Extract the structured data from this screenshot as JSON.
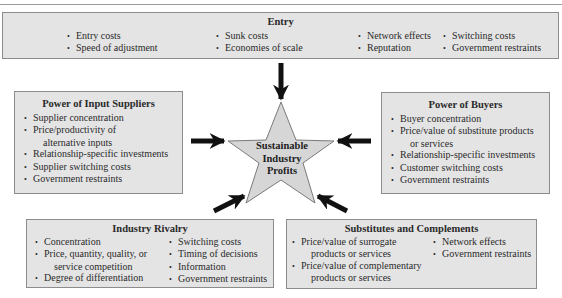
{
  "diagram_title": "Sustainable Industry Profits",
  "center": {
    "lines": [
      "Sustainable",
      "Industry",
      "Profits"
    ]
  },
  "entry": {
    "title": "Entry",
    "columns": [
      [
        "Entry costs",
        "Speed of adjustment"
      ],
      [
        "Sunk costs",
        "Economies of scale"
      ],
      [
        "Network effects",
        "Reputation"
      ],
      [
        "Switching costs",
        "Government restraints"
      ]
    ]
  },
  "suppliers": {
    "title": "Power of Input Suppliers",
    "items": [
      {
        "text": "Supplier concentration"
      },
      {
        "text": "Price/productivity of",
        "cont": "alternative inputs"
      },
      {
        "text": "Relationship-specific investments"
      },
      {
        "text": "Supplier switching costs"
      },
      {
        "text": "Government restraints"
      }
    ]
  },
  "buyers": {
    "title": "Power of Buyers",
    "items": [
      {
        "text": "Buyer concentration"
      },
      {
        "text": "Price/value of substitute products",
        "cont": "or services"
      },
      {
        "text": "Relationship-specific investments"
      },
      {
        "text": "Customer switching costs"
      },
      {
        "text": "Government restraints"
      }
    ]
  },
  "rivalry": {
    "title": "Industry Rivalry",
    "left": [
      {
        "text": "Concentration"
      },
      {
        "text": "Price, quantity, quality, or",
        "cont": "service competition"
      },
      {
        "text": "Degree of differentiation"
      }
    ],
    "right": [
      {
        "text": "Switching costs"
      },
      {
        "text": "Timing of decisions"
      },
      {
        "text": "Information"
      },
      {
        "text": "Government restraints"
      }
    ]
  },
  "substitutes": {
    "title": "Substitutes and Complements",
    "left": [
      {
        "text": "Price/value of surrogate",
        "cont": "products or services"
      },
      {
        "text": "Price/value of complementary",
        "cont": "products or services"
      }
    ],
    "right": [
      {
        "text": "Network effects"
      },
      {
        "text": "Government restraints"
      }
    ]
  },
  "colors": {
    "box_fill": "#e4e4e4",
    "box_border": "#8c8c8c",
    "star_fill": "#d6d6d6",
    "arrow": "#111111"
  }
}
